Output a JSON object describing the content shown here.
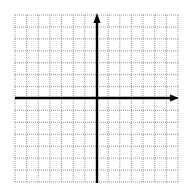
{
  "diagram": {
    "type": "coordinate-plane",
    "grid": {
      "columns": 14,
      "rows": 14,
      "left": 15,
      "top": 15,
      "right": 178,
      "bottom": 182,
      "line_style": "dotted",
      "line_color": "#8a8a8a"
    },
    "axes": {
      "origin_x": 97,
      "origin_y": 98,
      "color": "#000000",
      "x_axis": {
        "direction": "positive-arrow",
        "label": ""
      },
      "y_axis": {
        "direction": "positive-arrow",
        "label": ""
      }
    },
    "background": "#ffffff"
  }
}
